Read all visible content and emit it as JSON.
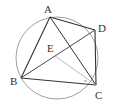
{
  "figure": {
    "type": "inscribed quadrilateral in circle",
    "circle": {
      "cx": 57,
      "cy": 58,
      "r": 41
    },
    "points": {
      "A": {
        "label": "A",
        "x": 50,
        "y": 17
      },
      "B": {
        "label": "B",
        "x": 21,
        "y": 78
      },
      "C": {
        "label": "C",
        "x": 96,
        "y": 85
      },
      "D": {
        "label": "D",
        "x": 95,
        "y": 30
      },
      "E": {
        "label": "E",
        "x": 53,
        "y": 52
      }
    },
    "angle_marks": [
      "α",
      "α"
    ],
    "colors": {
      "line": "#333333",
      "thin": "#9a9a9a",
      "circle": "#777777"
    }
  }
}
